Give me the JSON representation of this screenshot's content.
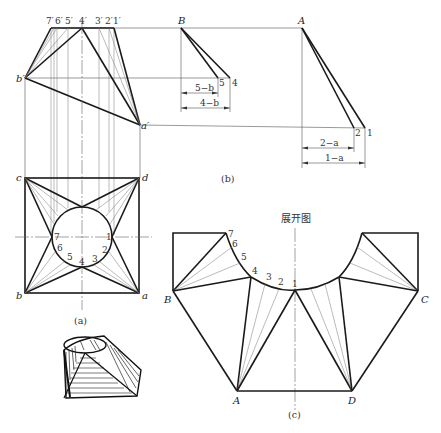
{
  "figure": {
    "front_view": {
      "top_labels": [
        "7′",
        "6′",
        "5′",
        "4′",
        "3′",
        "2′",
        "1′"
      ],
      "b_prime": "b′",
      "a_prime": "a′"
    },
    "top_view": {
      "corners": {
        "c": "c",
        "d": "d",
        "b": "b",
        "a": "a"
      },
      "circle_points": [
        "7",
        "6",
        "5",
        "4",
        "3",
        "2",
        "1"
      ],
      "caption": "(a)"
    },
    "true_length": {
      "B": "B",
      "pt5": "5",
      "pt4": "4",
      "dim_5b": "5−b",
      "dim_4b": "4−b",
      "A": "A",
      "pt2": "2",
      "pt1": "1",
      "dim_2a": "2−a",
      "dim_1a": "1−a",
      "caption": "(b)"
    },
    "development": {
      "title": "展开图",
      "arc_points": [
        "7",
        "6",
        "5",
        "4",
        "3",
        "2",
        "1"
      ],
      "vertices": {
        "B": "B",
        "A": "A",
        "D": "D",
        "C": "C"
      },
      "caption": "(c)"
    },
    "sketch": {
      "description": "isometric hatched sketch of square-to-round transition piece"
    }
  }
}
